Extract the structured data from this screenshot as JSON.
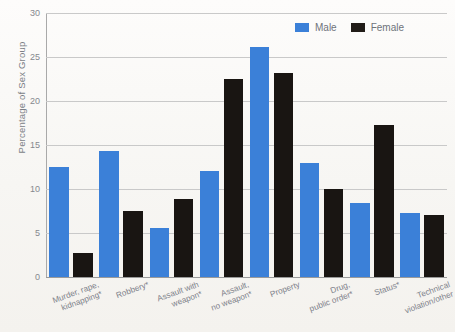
{
  "chart_data": {
    "type": "bar",
    "title": "",
    "xlabel": "",
    "ylabel": "Percentage of Sex Group",
    "ylim": [
      0,
      30
    ],
    "ytick_values": [
      0,
      5,
      10,
      15,
      20,
      25,
      30
    ],
    "ytick_labels": [
      "0",
      "5",
      "10",
      "15",
      "20",
      "25",
      "30"
    ],
    "grid": true,
    "legend_position": "top-right",
    "categories": [
      "Murder, rape,\nkidnapping*",
      "Robbery*",
      "Assault with\nweapon*",
      "Assault,\nno weapon*",
      "Property",
      "Drug,\npublic order*",
      "Status*",
      "Technical\nviolation/other"
    ],
    "series": [
      {
        "name": "Male",
        "color": "#3b80d8",
        "values": [
          12.5,
          14.3,
          5.6,
          12.0,
          26.1,
          13.0,
          8.4,
          7.3
        ]
      },
      {
        "name": "Female",
        "color": "#191512",
        "values": [
          2.7,
          7.5,
          8.9,
          22.5,
          23.2,
          10.0,
          17.3,
          7.0
        ]
      }
    ]
  },
  "legend": {
    "items": [
      {
        "label": "Male"
      },
      {
        "label": "Female"
      }
    ]
  }
}
